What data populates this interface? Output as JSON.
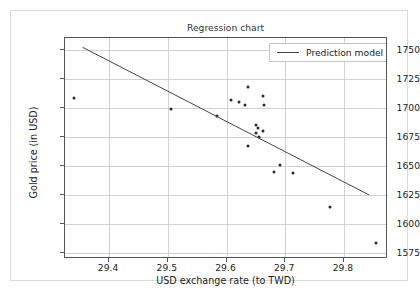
{
  "chart_data": {
    "type": "scatter",
    "title": "Regression chart",
    "xlabel": "USD exchange rate (to TWD)",
    "ylabel": "Gold price (in USD)",
    "xlim": [
      29.325,
      29.875
    ],
    "ylim": [
      1570,
      1760
    ],
    "grid": true,
    "legend_position": "upper right",
    "xticks": [
      "29.4",
      "29.5",
      "29.6",
      "29.7",
      "29.8"
    ],
    "xtick_values": [
      29.4,
      29.5,
      29.6,
      29.7,
      29.8
    ],
    "yticks": [
      "1575",
      "1600",
      "1625",
      "1650",
      "1675",
      "1700",
      "1725",
      "1750"
    ],
    "ytick_values": [
      1575,
      1600,
      1625,
      1650,
      1675,
      1700,
      1725,
      1750
    ],
    "series": [
      {
        "name": "Observations",
        "type": "scatter",
        "marker_color": "#2a2a2a",
        "points": [
          {
            "x": 29.34,
            "y": 1708
          },
          {
            "x": 29.505,
            "y": 1699
          },
          {
            "x": 29.583,
            "y": 1693
          },
          {
            "x": 29.608,
            "y": 1707
          },
          {
            "x": 29.622,
            "y": 1705
          },
          {
            "x": 29.631,
            "y": 1702
          },
          {
            "x": 29.637,
            "y": 1718
          },
          {
            "x": 29.636,
            "y": 1667
          },
          {
            "x": 29.651,
            "y": 1685
          },
          {
            "x": 29.653,
            "y": 1683
          },
          {
            "x": 29.65,
            "y": 1678
          },
          {
            "x": 29.655,
            "y": 1675
          },
          {
            "x": 29.662,
            "y": 1710
          },
          {
            "x": 29.664,
            "y": 1702
          },
          {
            "x": 29.663,
            "y": 1680
          },
          {
            "x": 29.681,
            "y": 1645
          },
          {
            "x": 29.691,
            "y": 1651
          },
          {
            "x": 29.713,
            "y": 1644
          },
          {
            "x": 29.776,
            "y": 1615
          },
          {
            "x": 29.855,
            "y": 1584
          }
        ]
      },
      {
        "name": "Prediction model",
        "type": "line",
        "line_color": "#444444",
        "endpoints": [
          {
            "x": 29.355,
            "y": 1752
          },
          {
            "x": 29.843,
            "y": 1625
          }
        ]
      }
    ],
    "legend": [
      {
        "label": "Prediction model",
        "marker": "line",
        "color": "#444444"
      }
    ]
  }
}
